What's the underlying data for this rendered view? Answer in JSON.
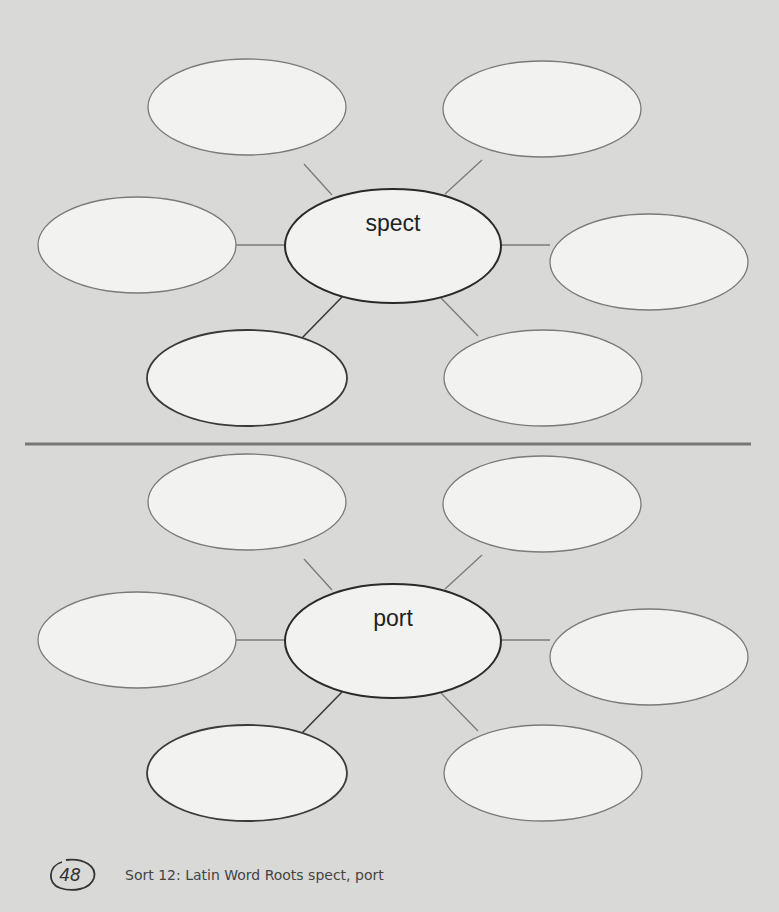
{
  "page": {
    "background_color": "#d9d9d7",
    "divider_color": "#777777"
  },
  "webs": [
    {
      "center_label": "spect",
      "satellites": [
        {
          "position": "top-left",
          "text": ""
        },
        {
          "position": "top-right",
          "text": ""
        },
        {
          "position": "left",
          "text": ""
        },
        {
          "position": "right",
          "text": ""
        },
        {
          "position": "bottom-left",
          "text": ""
        },
        {
          "position": "bottom-right",
          "text": ""
        }
      ]
    },
    {
      "center_label": "port",
      "satellites": [
        {
          "position": "top-left",
          "text": ""
        },
        {
          "position": "top-right",
          "text": ""
        },
        {
          "position": "left",
          "text": ""
        },
        {
          "position": "right",
          "text": ""
        },
        {
          "position": "bottom-left",
          "text": ""
        },
        {
          "position": "bottom-right",
          "text": ""
        }
      ]
    }
  ],
  "footer": {
    "page_number": "48",
    "caption": "Sort 12: Latin Word Roots spect, port"
  }
}
